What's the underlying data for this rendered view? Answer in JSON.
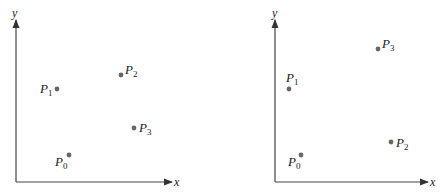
{
  "diagrams": [
    {
      "x_label": "x",
      "y_label": "y",
      "points": [
        {
          "name": "P",
          "sub": "0",
          "x": 69,
          "y": 155
        },
        {
          "name": "P",
          "sub": "1",
          "x": 57,
          "y": 89
        },
        {
          "name": "P",
          "sub": "2",
          "x": 121,
          "y": 75
        },
        {
          "name": "P",
          "sub": "3",
          "x": 134,
          "y": 128
        }
      ]
    },
    {
      "x_label": "x",
      "y_label": "y",
      "points": [
        {
          "name": "P",
          "sub": "0",
          "x": 301,
          "y": 155
        },
        {
          "name": "P",
          "sub": "1",
          "x": 289,
          "y": 89
        },
        {
          "name": "P",
          "sub": "2",
          "x": 391,
          "y": 142
        },
        {
          "name": "P",
          "sub": "3",
          "x": 378,
          "y": 49
        }
      ]
    }
  ],
  "colors": {
    "axis": "#333333",
    "point": "#666666",
    "text": "#222222"
  }
}
